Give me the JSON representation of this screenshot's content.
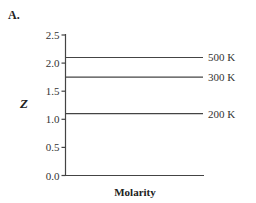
{
  "panel": {
    "label": "A."
  },
  "chart_data": {
    "type": "line",
    "title": "",
    "xlabel": "Molarity",
    "ylabel": "Z",
    "ylim": [
      0.0,
      2.5
    ],
    "yticks": [
      "0.0",
      "0.5",
      "1.0",
      "1.5",
      "2.0",
      "2.5"
    ],
    "xticks": [],
    "grid": false,
    "legend_position": "inline-right",
    "series": [
      {
        "name": "500 K",
        "values": [
          2.1,
          2.1
        ]
      },
      {
        "name": "300 K",
        "values": [
          1.75,
          1.75
        ]
      },
      {
        "name": "200 K",
        "values": [
          1.1,
          1.1
        ]
      }
    ]
  }
}
